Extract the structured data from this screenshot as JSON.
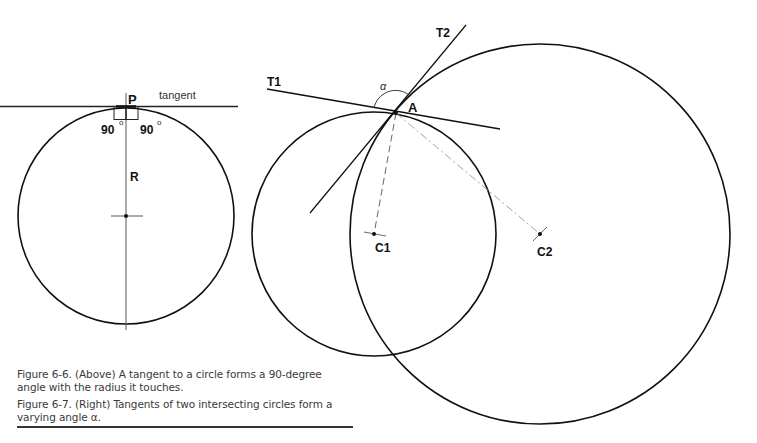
{
  "figure_6_6": {
    "labels": {
      "point": "P",
      "tangent": "tangent",
      "angle_left": "90",
      "angle_right": "90",
      "degree": "o",
      "radius": "R"
    },
    "circle": {
      "cx": 126,
      "cy": 216,
      "r": 108
    }
  },
  "figure_6_7": {
    "labels": {
      "tangent1": "T1",
      "tangent2": "T2",
      "intersection": "A",
      "alpha": "α",
      "center1": "C1",
      "center2": "C2"
    },
    "circle1": {
      "cx": 374,
      "cy": 234,
      "r": 122
    },
    "circle2": {
      "cx": 540,
      "cy": 234,
      "r": 190
    }
  },
  "captions": {
    "fig66": "Figure 6-6. (Above) A tangent to a circle forms a 90-degree angle with the radius it touches.",
    "fig67": "Figure 6-7. (Right) Tangents of two intersecting circles form a varying angle α."
  },
  "colors": {
    "ink": "#111111",
    "dash": "#888888",
    "caption": "#3a3a3a"
  }
}
